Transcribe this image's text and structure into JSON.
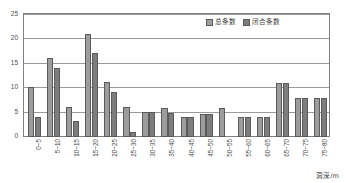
{
  "chart_data": {
    "type": "bar",
    "title": "",
    "subtitle": "",
    "xlabel": "洞深/m",
    "ylabel": "",
    "ylim": [
      0,
      25
    ],
    "yticks": [
      0,
      5,
      10,
      15,
      20,
      25
    ],
    "grid": true,
    "legend_position": "top-right",
    "categories": [
      "0~5",
      "5~10",
      "10~15",
      "15~20",
      "20~25",
      "25~30",
      "30~35",
      "35~40",
      "40~45",
      "45~50",
      "50~55",
      "55~60",
      "60~65",
      "65~70",
      "70~75",
      "75~80"
    ],
    "series": [
      {
        "name": "总条数",
        "color": "#9c9c9c",
        "values": [
          10.3,
          16.2,
          6.2,
          21.2,
          11.3,
          6.2,
          5.2,
          6.0,
          4.0,
          4.8,
          5.9,
          4.0,
          4.0,
          11.0,
          8.0,
          8.0
        ]
      },
      {
        "name": "闭合条数",
        "color": "#7d7d7d",
        "values": [
          4.0,
          14.2,
          3.2,
          17.2,
          9.2,
          1.1,
          5.2,
          4.9,
          4.0,
          4.8,
          0.0,
          4.0,
          4.0,
          11.0,
          8.0,
          8.0
        ]
      }
    ]
  },
  "legend": {
    "items": [
      {
        "label": "总条数"
      },
      {
        "label": "闭合条数"
      }
    ]
  },
  "axis": {
    "x_title": "洞深/m"
  }
}
